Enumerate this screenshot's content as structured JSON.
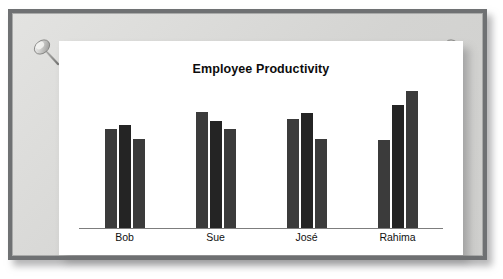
{
  "board": {
    "pin_left": "pushpin-icon",
    "pin_right": "pushpin-icon"
  },
  "chart_data": {
    "type": "bar",
    "title": "Employee Productivity",
    "xlabel": "",
    "ylabel": "",
    "grid": false,
    "legend": "none",
    "axis_line": true,
    "categories": [
      "Bob",
      "Sue",
      "José",
      "Rahima"
    ],
    "ylim": [
      0,
      120
    ],
    "series": [
      {
        "name": "Measure 1",
        "color": "#3b3b3b",
        "values": [
          84,
          99,
          93,
          75
        ]
      },
      {
        "name": "Measure 2",
        "color": "#242424",
        "values": [
          88,
          91,
          98,
          105
        ]
      },
      {
        "name": "Measure 3",
        "color": "#3b3b3b",
        "values": [
          76,
          84,
          76,
          117
        ]
      }
    ],
    "bars": [
      {
        "category": "Bob",
        "values": [
          84,
          88,
          76
        ]
      },
      {
        "category": "Sue",
        "values": [
          99,
          91,
          84
        ]
      },
      {
        "category": "José",
        "values": [
          93,
          98,
          76
        ]
      },
      {
        "category": "Rahima",
        "values": [
          75,
          105,
          117
        ]
      }
    ]
  },
  "colors": {
    "bar": "#3b3b3b",
    "bar_dark": "#242424",
    "frame": "#6f7173",
    "mat": "#d9d9d7",
    "paper": "#ffffff",
    "axis": "#7d7d7d"
  }
}
